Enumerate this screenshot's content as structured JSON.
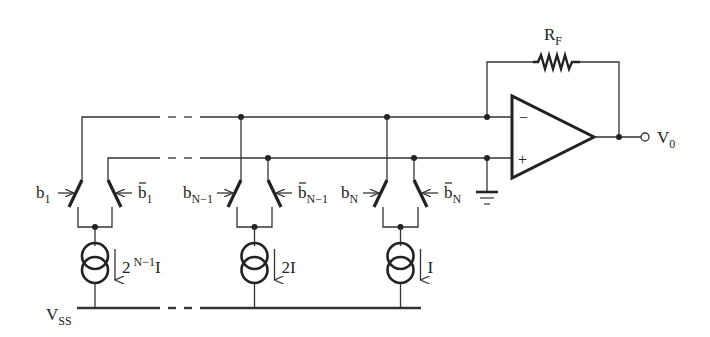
{
  "feedback_resistor": {
    "label": "R",
    "subscript": "F"
  },
  "opamp": {
    "inverting_sign": "−",
    "noninverting_sign": "+"
  },
  "output": {
    "label": "V",
    "subscript": "0"
  },
  "supply": {
    "label": "V",
    "subscript": "SS"
  },
  "branches": [
    {
      "switch_left": {
        "label": "b",
        "subscript": "1",
        "bar": false
      },
      "switch_right": {
        "label": "b",
        "subscript": "1",
        "bar": true
      },
      "current_source": {
        "base": "2",
        "exponent": "N−1",
        "unit": "I"
      }
    },
    {
      "switch_left": {
        "label": "b",
        "subscript": "N−1",
        "bar": false
      },
      "switch_right": {
        "label": "b",
        "subscript": "N−1",
        "bar": true
      },
      "current_source": {
        "base": "",
        "exponent": "",
        "unit": "2I"
      }
    },
    {
      "switch_left": {
        "label": "b",
        "subscript": "N",
        "bar": false
      },
      "switch_right": {
        "label": "b",
        "subscript": "N",
        "bar": true
      },
      "current_source": {
        "base": "",
        "exponent": "",
        "unit": "I"
      }
    }
  ],
  "ground": {
    "symbol": "ground"
  }
}
